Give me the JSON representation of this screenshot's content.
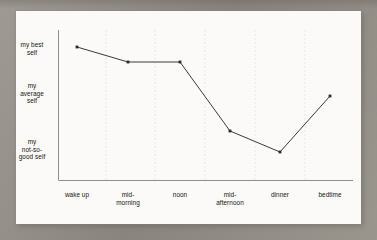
{
  "chart_data": {
    "type": "line",
    "title": "",
    "subtitle": "",
    "xlabel": "",
    "ylabel": "",
    "categories": [
      "wake up",
      "mid-\nmorning",
      "noon",
      "mid-\nafternoon",
      "dinner",
      "bedtime"
    ],
    "x_tick_labels": [
      {
        "line1": "wake up",
        "line2": ""
      },
      {
        "line1": "mid-",
        "line2": "morning"
      },
      {
        "line1": "noon",
        "line2": ""
      },
      {
        "line1": "mid-",
        "line2": "afternoon"
      },
      {
        "line1": "dinner",
        "line2": ""
      },
      {
        "line1": "bedtime",
        "line2": ""
      }
    ],
    "y_tick_labels": [
      {
        "line1": "my best",
        "line2": "self",
        "line3": ""
      },
      {
        "line1": "my",
        "line2": "average",
        "line3": "self"
      },
      {
        "line1": "my",
        "line2": "not-so-",
        "line3": "good self"
      }
    ],
    "y_categories": [
      "my best self",
      "my average self",
      "my not-so-good self"
    ],
    "values": [
      3.0,
      2.7,
      2.7,
      1.35,
      0.93,
      2.1
    ],
    "series": [
      {
        "name": "energy level through the day",
        "points": [
          {
            "x": "wake up",
            "y_label": "my best self",
            "value": 3.0,
            "px": 77,
            "py": 47
          },
          {
            "x": "mid-morning",
            "y_label": "near my best self",
            "value": 2.7,
            "px": 128,
            "py": 62
          },
          {
            "x": "noon",
            "y_label": "near my best self",
            "value": 2.7,
            "px": 180,
            "py": 62
          },
          {
            "x": "mid-afternoon",
            "y_label": "below average self",
            "value": 1.35,
            "px": 230,
            "py": 131
          },
          {
            "x": "dinner",
            "y_label": "my not-so-good self",
            "value": 0.93,
            "px": 280,
            "py": 152
          },
          {
            "x": "bedtime",
            "y_label": "my average self",
            "value": 2.1,
            "px": 330,
            "py": 96
          }
        ]
      }
    ],
    "ylim": [
      0,
      3.3
    ],
    "grid": {
      "vertical": true,
      "horizontal": false,
      "style": "dotted",
      "count": 5
    },
    "legend": {
      "visible": false,
      "position": "none"
    },
    "axis": {
      "y_line": true,
      "x_line": true,
      "ticks_visible": false
    },
    "colors": {
      "line": "#3b3a38",
      "marker": "#2b2a28",
      "axis": "#8d8b88",
      "gridline": "#d9d6d0",
      "text": "#16150f",
      "page": "#fbfaf8",
      "backdrop": "#9d9991"
    }
  }
}
